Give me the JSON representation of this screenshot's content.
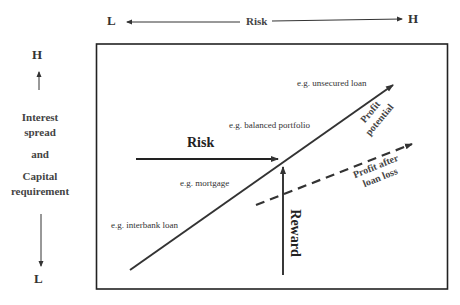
{
  "top_axis": {
    "low_label": "L",
    "title": "Risk",
    "high_label": "H"
  },
  "left_axis": {
    "high_label": "H",
    "title_lines": [
      "Interest",
      "spread",
      "and",
      "Capital",
      "requirement"
    ],
    "low_label": "L"
  },
  "plot": {
    "examples": {
      "unsecured": "e.g. unsecured loan",
      "balanced": "e.g. balanced portfolio",
      "mortgage": "e.g. mortgage",
      "interbank": "e.g. interbank loan"
    },
    "risk_arrow_label": "Risk",
    "reward_arrow_label": "Reward",
    "profit_potential_line1": "Profit",
    "profit_potential_line2": "potential",
    "profit_after_line1": "Profit after",
    "profit_after_line2": "loan loss"
  },
  "colors": {
    "line": "#333333",
    "frame": "#222222",
    "background": "#ffffff"
  }
}
